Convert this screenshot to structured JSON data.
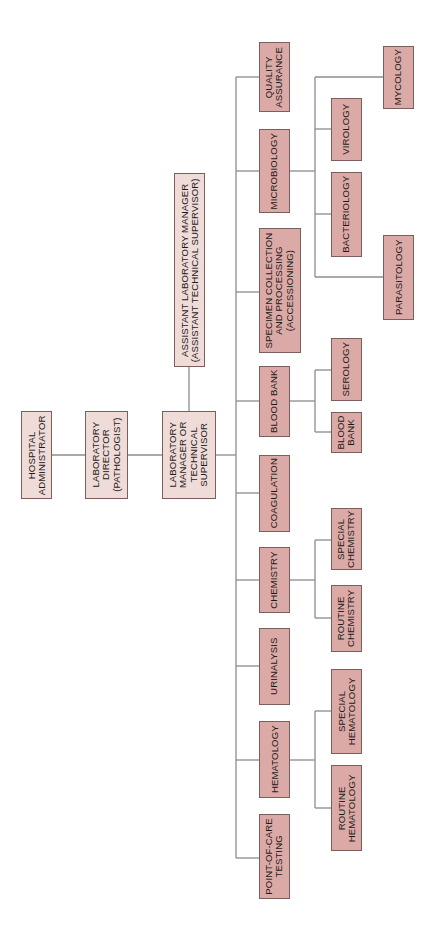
{
  "colors": {
    "top_box_fill": "#efdcd8",
    "dept_box_fill": "#dcaaa6",
    "box_border": "#7d5e5b",
    "connector_line": "#8c8c8c",
    "background": "#ffffff"
  },
  "chain": {
    "hospital_administrator": "HOSPITAL\nADMINISTRATOR",
    "laboratory_director": "LABORATORY\nDIRECTOR\n(PATHOLOGIST)",
    "laboratory_manager": "LABORATORY\nMANAGER OR\nTECHNICAL\nSUPERVISOR",
    "assistant_manager": "ASSISTANT LABORATORY MANAGER\n(ASSISTANT TECHNICAL SUPERVISOR)"
  },
  "departments": [
    {
      "id": "quality",
      "label": "QUALITY\nASSURANCE",
      "sub": []
    },
    {
      "id": "microbiology",
      "label": "MICROBIOLOGY",
      "sub": [
        "MYCOLOGY",
        "VIROLOGY",
        "BACTERIOLOGY",
        "PARASITOLOGY"
      ]
    },
    {
      "id": "specimen",
      "label": "SPECIMEN COLLECTION\nAND PROCESSING\n(ACCESSIONING)",
      "sub": []
    },
    {
      "id": "bloodbank",
      "label": "BLOOD BANK",
      "sub": [
        "SEROLOGY",
        "BLOOD\nBANK"
      ]
    },
    {
      "id": "coagulation",
      "label": "COAGULATION",
      "sub": []
    },
    {
      "id": "chemistry",
      "label": "CHEMISTRY",
      "sub": [
        "SPECIAL\nCHEMISTRY",
        "ROUTINE\nCHEMISTRY"
      ]
    },
    {
      "id": "urinalysis",
      "label": "URINALYSIS",
      "sub": []
    },
    {
      "id": "hematology",
      "label": "HEMATOLOGY",
      "sub": [
        "SPECIAL\nHEMATOLOGY",
        "ROUTINE\nHEMATOLOGY"
      ]
    },
    {
      "id": "poc",
      "label": "POINT-OF-CARE\nTESTING",
      "sub": []
    }
  ]
}
